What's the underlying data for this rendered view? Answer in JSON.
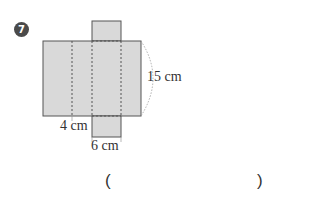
{
  "problem": {
    "number": "7",
    "labels": {
      "height": "15 cm",
      "width_left": "4 cm",
      "width_flap": "6 cm"
    },
    "answer_open": "(",
    "answer_close": ")",
    "answer_value": ""
  },
  "colors": {
    "fill": "#d9d9d9",
    "stroke": "#555555",
    "badge": "#4a4a4a"
  }
}
